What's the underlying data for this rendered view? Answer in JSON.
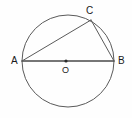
{
  "figure": {
    "type": "geometry-diagram",
    "background_color": "#fefefe",
    "stroke_color": "#5a5a5a",
    "label_color": "#1a1a1a",
    "canvas": {
      "width": 132,
      "height": 118
    }
  },
  "circle": {
    "name": "circle-O",
    "center": {
      "x": 68,
      "y": 61
    },
    "radius": 46,
    "stroke_color": "#5a5a5a",
    "stroke_width": 1,
    "fill": "none"
  },
  "center_point": {
    "name": "center-dot",
    "x": 66,
    "y": 61,
    "radius": 1.6,
    "color": "#2b2b2b"
  },
  "points": [
    {
      "id": "A",
      "label": "A",
      "x": 22,
      "y": 61,
      "label_x": 11,
      "label_y": 56
    },
    {
      "id": "B",
      "label": "B",
      "x": 114,
      "y": 61,
      "label_x": 118,
      "label_y": 56
    },
    {
      "id": "C",
      "label": "C",
      "x": 91,
      "y": 20,
      "label_x": 86,
      "label_y": 6
    },
    {
      "id": "O",
      "label": "O",
      "x": 66,
      "y": 61,
      "label_x": 62,
      "label_y": 66
    }
  ],
  "segments": [
    {
      "id": "AB",
      "name": "diameter-AB",
      "from": "A",
      "to": "B",
      "x1": 22,
      "y1": 61,
      "x2": 114,
      "y2": 61,
      "stroke_width": 1.3
    },
    {
      "id": "AC",
      "name": "chord-AC",
      "from": "A",
      "to": "C",
      "x1": 22,
      "y1": 61,
      "x2": 91,
      "y2": 20,
      "stroke_width": 1
    },
    {
      "id": "CB",
      "name": "chord-CB",
      "from": "C",
      "to": "B",
      "x1": 91,
      "y1": 20,
      "x2": 114,
      "y2": 61,
      "stroke_width": 1
    }
  ],
  "labels": {
    "A": "A",
    "B": "B",
    "C": "C",
    "O": "O"
  }
}
